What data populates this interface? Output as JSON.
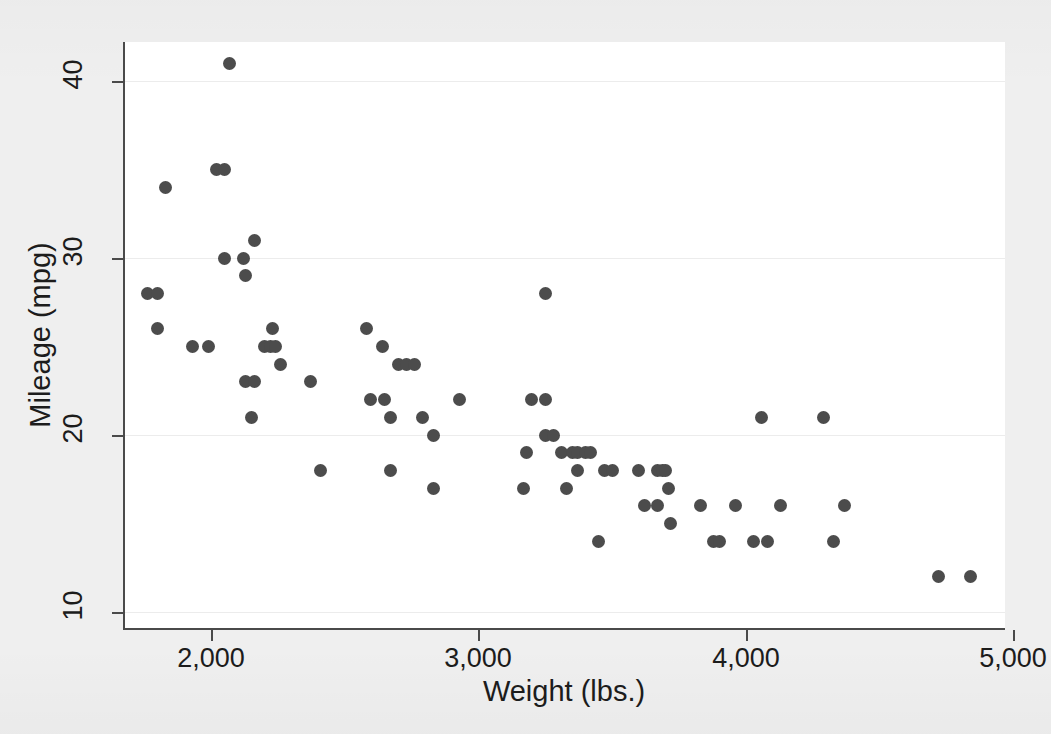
{
  "figure": {
    "background_color": "#efefef",
    "plot_background_color": "#ffffff",
    "axis_color": "#4a4a4a",
    "marker_color": "#4c4c4c",
    "grid_color": "#ececec"
  },
  "chart_data": {
    "type": "scatter",
    "title": "",
    "xlabel": "Weight (lbs.)",
    "ylabel": "Mileage (mpg)",
    "xlim": [
      1670,
      4970
    ],
    "ylim": [
      9.1,
      42.2
    ],
    "xticks": [
      2000,
      3000,
      4000,
      5000
    ],
    "xtick_labels": [
      "2,000",
      "3,000",
      "4,000",
      "5,000"
    ],
    "yticks": [
      10,
      20,
      30,
      40
    ],
    "ytick_labels": [
      "10",
      "20",
      "30",
      "40"
    ],
    "grid": "horizontal",
    "legend": "none",
    "marker": "filled-circle",
    "n_points": 74,
    "x": [
      2930,
      3350,
      2640,
      3250,
      4080,
      3670,
      2230,
      3280,
      3880,
      4330,
      3900,
      4290,
      4080,
      3670,
      3370,
      4130,
      4370,
      4030,
      3620,
      4130,
      3720,
      3370,
      3080,
      3670,
      3400,
      2200,
      2150,
      2670,
      2595,
      2700,
      2556,
      2200,
      3030,
      3350,
      2640,
      2830,
      3250,
      4080,
      3670,
      3710,
      2580,
      2200,
      2370,
      2020,
      2130,
      1800,
      1760,
      2050,
      2410,
      2200,
      2520,
      2650,
      1760,
      2050,
      1930,
      1990,
      3170,
      2690,
      3310,
      2440,
      2830,
      2120,
      1800,
      2160,
      2040,
      1930,
      2670,
      3420,
      3690,
      3180,
      3600,
      4720,
      4840,
      2160
    ],
    "y": [
      22,
      17,
      22,
      22,
      20,
      15,
      26,
      20,
      16,
      19,
      19,
      14,
      14,
      21,
      29,
      16,
      16,
      16,
      18,
      18,
      18,
      19,
      19,
      17,
      19,
      24,
      25,
      25,
      18,
      20,
      21,
      22,
      22,
      20,
      22,
      18,
      22,
      21,
      15,
      17,
      21,
      25,
      23,
      35,
      23,
      28,
      34,
      41,
      18,
      24,
      22,
      24,
      28,
      35,
      26,
      30,
      17,
      25,
      28,
      23,
      20,
      30,
      26,
      31,
      25,
      29,
      24,
      14,
      18,
      19,
      18,
      12,
      12,
      21
    ],
    "points": [
      {
        "w": 1760,
        "m": 28
      },
      {
        "w": 1800,
        "m": 28
      },
      {
        "w": 1800,
        "m": 26
      },
      {
        "w": 1830,
        "m": 34
      },
      {
        "w": 1930,
        "m": 25
      },
      {
        "w": 1990,
        "m": 25
      },
      {
        "w": 2020,
        "m": 35
      },
      {
        "w": 2050,
        "m": 35
      },
      {
        "w": 2070,
        "m": 41
      },
      {
        "w": 2050,
        "m": 30
      },
      {
        "w": 2120,
        "m": 30
      },
      {
        "w": 2130,
        "m": 29
      },
      {
        "w": 2160,
        "m": 31
      },
      {
        "w": 2130,
        "m": 23
      },
      {
        "w": 2160,
        "m": 23
      },
      {
        "w": 2150,
        "m": 21
      },
      {
        "w": 2200,
        "m": 25
      },
      {
        "w": 2220,
        "m": 25
      },
      {
        "w": 2230,
        "m": 26
      },
      {
        "w": 2240,
        "m": 25
      },
      {
        "w": 2260,
        "m": 24
      },
      {
        "w": 2370,
        "m": 23
      },
      {
        "w": 2410,
        "m": 18
      },
      {
        "w": 2580,
        "m": 26
      },
      {
        "w": 2595,
        "m": 22
      },
      {
        "w": 2650,
        "m": 22
      },
      {
        "w": 2640,
        "m": 25
      },
      {
        "w": 2670,
        "m": 21
      },
      {
        "w": 2670,
        "m": 18
      },
      {
        "w": 2700,
        "m": 24
      },
      {
        "w": 2730,
        "m": 24
      },
      {
        "w": 2760,
        "m": 24
      },
      {
        "w": 2790,
        "m": 21
      },
      {
        "w": 2830,
        "m": 20
      },
      {
        "w": 2830,
        "m": 17
      },
      {
        "w": 2930,
        "m": 22
      },
      {
        "w": 3170,
        "m": 17
      },
      {
        "w": 3180,
        "m": 19
      },
      {
        "w": 3200,
        "m": 22
      },
      {
        "w": 3250,
        "m": 22
      },
      {
        "w": 3250,
        "m": 28
      },
      {
        "w": 3250,
        "m": 20
      },
      {
        "w": 3280,
        "m": 20
      },
      {
        "w": 3310,
        "m": 19
      },
      {
        "w": 3350,
        "m": 19
      },
      {
        "w": 3370,
        "m": 19
      },
      {
        "w": 3400,
        "m": 19
      },
      {
        "w": 3420,
        "m": 19
      },
      {
        "w": 3330,
        "m": 17
      },
      {
        "w": 3370,
        "m": 18
      },
      {
        "w": 3450,
        "m": 14
      },
      {
        "w": 3470,
        "m": 18
      },
      {
        "w": 3600,
        "m": 18
      },
      {
        "w": 3620,
        "m": 16
      },
      {
        "w": 3670,
        "m": 18
      },
      {
        "w": 3690,
        "m": 18
      },
      {
        "w": 3700,
        "m": 18
      },
      {
        "w": 3670,
        "m": 16
      },
      {
        "w": 3710,
        "m": 17
      },
      {
        "w": 3720,
        "m": 15
      },
      {
        "w": 3830,
        "m": 16
      },
      {
        "w": 3880,
        "m": 14
      },
      {
        "w": 3900,
        "m": 14
      },
      {
        "w": 3960,
        "m": 16
      },
      {
        "w": 4030,
        "m": 14
      },
      {
        "w": 4060,
        "m": 21
      },
      {
        "w": 4080,
        "m": 14
      },
      {
        "w": 4130,
        "m": 16
      },
      {
        "w": 4290,
        "m": 21
      },
      {
        "w": 4330,
        "m": 14
      },
      {
        "w": 4370,
        "m": 16
      },
      {
        "w": 4720,
        "m": 12
      },
      {
        "w": 4840,
        "m": 12
      },
      {
        "w": 3500,
        "m": 18
      }
    ]
  }
}
